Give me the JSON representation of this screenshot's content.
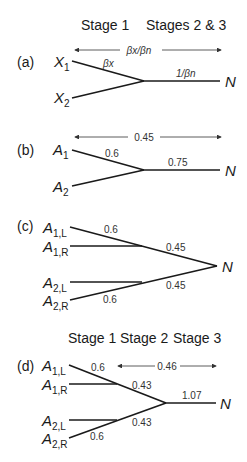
{
  "headers": {
    "top_stage1": "Stage 1",
    "top_stage23": "Stages 2 & 3",
    "bottom_stage1": "Stage 1",
    "bottom_stage2": "Stage 2",
    "bottom_stage3": "Stage 3"
  },
  "panels": {
    "a": {
      "label": "(a)",
      "inputs": [
        {
          "base": "X",
          "sub": "1"
        },
        {
          "base": "X",
          "sub": "2"
        }
      ],
      "output": "N",
      "branch_weight": "βx",
      "trunk_weight": "1/βn",
      "span_label": "βx/βn"
    },
    "b": {
      "label": "(b)",
      "inputs": [
        {
          "base": "A",
          "sub": "1"
        },
        {
          "base": "A",
          "sub": "2"
        }
      ],
      "output": "N",
      "branch_weight": "0.6",
      "trunk_weight": "0.75",
      "span_label": "0.45"
    },
    "c": {
      "label": "(c)",
      "inputs": [
        {
          "base": "A",
          "sub": "1,L"
        },
        {
          "base": "A",
          "sub": "1,R"
        },
        {
          "base": "A",
          "sub": "2,L"
        },
        {
          "base": "A",
          "sub": "2,R"
        }
      ],
      "output": "N",
      "branch_weight_top": "0.6",
      "trunk_weight_top": "0.45",
      "trunk_weight_bottom": "0.45",
      "branch_weight_bottom": "0.6"
    },
    "d": {
      "label": "(d)",
      "inputs": [
        {
          "base": "A",
          "sub": "1,L"
        },
        {
          "base": "A",
          "sub": "1,R"
        },
        {
          "base": "A",
          "sub": "2,L"
        },
        {
          "base": "A",
          "sub": "2,R"
        }
      ],
      "output": "N",
      "branch_weight_top": "0.6",
      "mid_weight_top": "0.43",
      "mid_weight_bottom": "0.43",
      "branch_weight_bottom": "0.6",
      "trunk_weight": "1.07",
      "span_label": "0.46"
    }
  }
}
